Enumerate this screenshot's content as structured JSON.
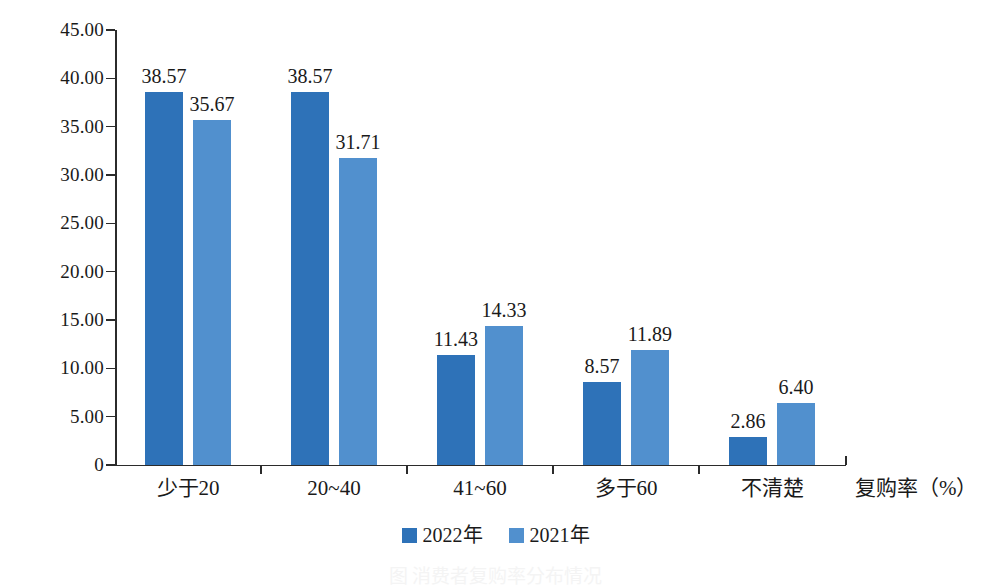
{
  "chart_data": {
    "type": "bar",
    "title": "",
    "subtitle": "",
    "xlabel": "复购率（%）",
    "ylabel": "百分比（%）",
    "categories": [
      "少于20",
      "20~40",
      "41~60",
      "多于60",
      "不清楚"
    ],
    "series": [
      {
        "name": "2022年",
        "color": "#2e72b8",
        "values": [
          38.57,
          38.57,
          11.43,
          8.57,
          2.86
        ]
      },
      {
        "name": "2021年",
        "color": "#5190ce",
        "values": [
          35.67,
          31.71,
          14.33,
          11.89,
          6.4
        ]
      }
    ],
    "value_labels": [
      [
        "38.57",
        "35.67"
      ],
      [
        "38.57",
        "31.71"
      ],
      [
        "11.43",
        "14.33"
      ],
      [
        "8.57",
        "11.89"
      ],
      [
        "2.86",
        "6.40"
      ]
    ],
    "ylim": [
      0,
      45
    ],
    "ytick_values": [
      0,
      5,
      10,
      15,
      20,
      25,
      30,
      35,
      40,
      45
    ],
    "ytick_labels": [
      "0",
      "5.00",
      "10.00",
      "15.00",
      "20.00",
      "25.00",
      "30.00",
      "35.00",
      "40.00",
      "45.00"
    ],
    "grid": false,
    "legend_position": "bottom-center"
  },
  "legend": {
    "items": [
      {
        "label": "2022年",
        "color": "#2e72b8"
      },
      {
        "label": "2021年",
        "color": "#5190ce"
      }
    ]
  },
  "caption": {
    "text": "图 消费者复购率分布情况"
  }
}
